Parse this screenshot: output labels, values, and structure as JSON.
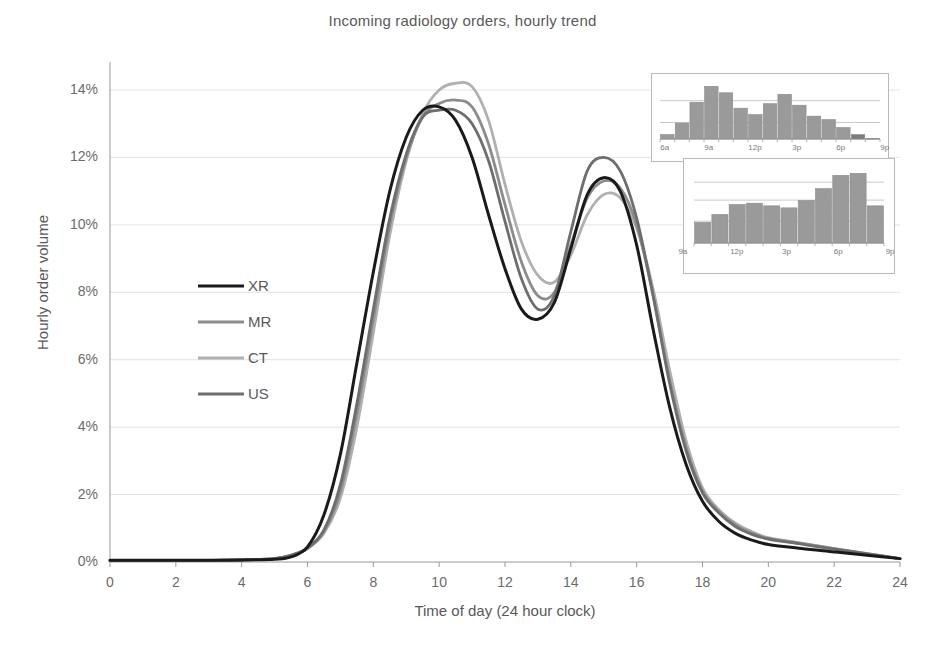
{
  "chart_data": {
    "type": "line",
    "title": "Incoming radiology orders, hourly trend",
    "xlabel": "Time of day (24 hour clock)",
    "ylabel": "Hourly order volume",
    "xlim": [
      0,
      24
    ],
    "ylim": [
      0,
      14.8
    ],
    "grid": true,
    "legend_position": "inside-left",
    "xticks": [
      "0",
      "2",
      "4",
      "6",
      "8",
      "10",
      "12",
      "14",
      "16",
      "18",
      "20",
      "22",
      "24"
    ],
    "xtick_values": [
      0,
      2,
      4,
      6,
      8,
      10,
      12,
      14,
      16,
      18,
      20,
      22,
      24
    ],
    "yticks": [
      "0%",
      "2%",
      "4%",
      "6%",
      "8%",
      "10%",
      "12%",
      "14%"
    ],
    "ytick_values": [
      0,
      2,
      4,
      6,
      8,
      10,
      12,
      14
    ],
    "x": [
      0,
      1,
      2,
      3,
      4,
      5,
      5.5,
      6,
      6.5,
      7,
      7.5,
      8,
      8.5,
      9,
      9.5,
      10,
      10.5,
      11,
      11.5,
      12,
      12.5,
      13,
      13.5,
      14,
      14.5,
      15,
      15.5,
      16,
      16.5,
      17,
      17.5,
      18,
      18.5,
      19,
      19.5,
      20,
      21,
      22,
      23,
      24
    ],
    "series": [
      {
        "name": "XR",
        "color": "#1a1a1a",
        "values": [
          0.05,
          0.05,
          0.05,
          0.05,
          0.06,
          0.08,
          0.15,
          0.45,
          1.4,
          3.2,
          5.9,
          8.6,
          11.0,
          12.6,
          13.4,
          13.5,
          13.1,
          12.0,
          10.3,
          8.7,
          7.5,
          7.2,
          7.7,
          9.3,
          10.9,
          11.4,
          11.0,
          9.4,
          6.9,
          4.6,
          2.9,
          1.8,
          1.2,
          0.85,
          0.65,
          0.52,
          0.4,
          0.3,
          0.2,
          0.1
        ]
      },
      {
        "name": "MR",
        "color": "#8c8c8c",
        "values": [
          0.05,
          0.05,
          0.05,
          0.05,
          0.06,
          0.1,
          0.2,
          0.4,
          0.9,
          2.1,
          4.4,
          7.2,
          10.0,
          12.0,
          13.2,
          13.6,
          13.7,
          13.5,
          12.4,
          10.6,
          8.9,
          7.9,
          8.0,
          9.4,
          10.8,
          11.3,
          11.1,
          10.0,
          7.9,
          5.4,
          3.4,
          2.1,
          1.5,
          1.1,
          0.85,
          0.7,
          0.55,
          0.4,
          0.25,
          0.1
        ]
      },
      {
        "name": "CT",
        "color": "#b0b0b0",
        "values": [
          0.05,
          0.05,
          0.05,
          0.05,
          0.06,
          0.1,
          0.2,
          0.4,
          0.85,
          1.9,
          4.0,
          6.8,
          9.7,
          11.9,
          13.3,
          14.0,
          14.2,
          14.1,
          13.1,
          11.2,
          9.5,
          8.5,
          8.3,
          9.1,
          10.3,
          10.9,
          10.8,
          9.9,
          8.1,
          5.7,
          3.6,
          2.2,
          1.55,
          1.15,
          0.9,
          0.72,
          0.56,
          0.4,
          0.25,
          0.1
        ]
      },
      {
        "name": "US",
        "color": "#6e6e6e",
        "values": [
          0.05,
          0.05,
          0.05,
          0.05,
          0.06,
          0.1,
          0.2,
          0.42,
          0.95,
          2.3,
          4.7,
          7.5,
          10.2,
          12.1,
          13.2,
          13.4,
          13.4,
          13.0,
          11.9,
          10.1,
          8.4,
          7.5,
          7.9,
          9.8,
          11.6,
          12.0,
          11.6,
          10.2,
          7.9,
          5.3,
          3.3,
          2.05,
          1.45,
          1.05,
          0.82,
          0.68,
          0.53,
          0.38,
          0.24,
          0.1
        ]
      }
    ],
    "legend": [
      {
        "label": "XR",
        "color": "#1a1a1a"
      },
      {
        "label": "MR",
        "color": "#8c8c8c"
      },
      {
        "label": "CT",
        "color": "#b0b0b0"
      },
      {
        "label": "US",
        "color": "#6e6e6e"
      }
    ],
    "insets": [
      {
        "name": "inset-morning-bars",
        "type": "bar",
        "bar_color": "#9a9a9a",
        "highlight_bar_color": "#7d7d7d",
        "xticks": [
          "6a",
          "9a",
          "12p",
          "3p",
          "6p",
          "9p"
        ],
        "xtick_values": [
          6,
          9,
          12,
          15,
          18,
          21
        ],
        "categories": [
          6,
          7,
          8,
          9,
          10,
          11,
          12,
          13,
          14,
          15,
          16,
          17,
          18,
          19,
          20
        ],
        "values": [
          0.9,
          3.2,
          7.4,
          10.6,
          9.3,
          6.2,
          4.9,
          7.1,
          9.0,
          6.8,
          4.6,
          3.9,
          2.3,
          0.9,
          0.1
        ],
        "highlight_index": 13
      },
      {
        "name": "inset-afternoon-bars",
        "type": "bar",
        "bar_color": "#9a9a9a",
        "xticks": [
          "9a",
          "12p",
          "3p",
          "6p",
          "9p"
        ],
        "xtick_values": [
          9,
          12,
          15,
          18,
          21
        ],
        "categories": [
          10,
          11,
          12,
          13,
          14,
          15,
          16,
          17,
          18,
          19,
          20
        ],
        "values": [
          3.1,
          4.3,
          5.8,
          6.0,
          5.6,
          5.3,
          6.4,
          8.2,
          10.2,
          10.5,
          5.6
        ]
      }
    ]
  }
}
